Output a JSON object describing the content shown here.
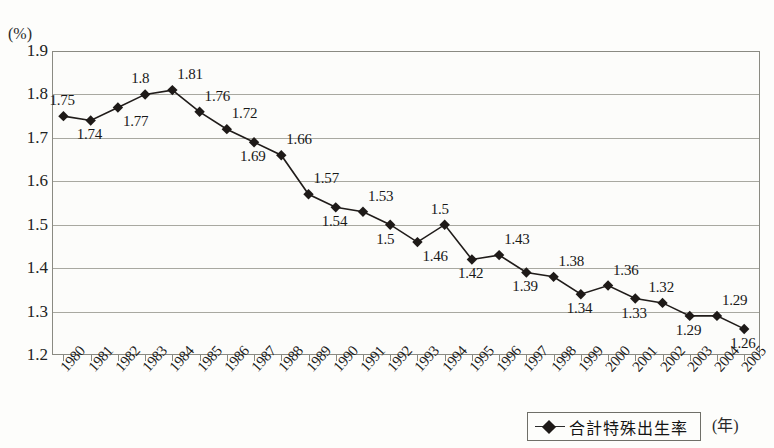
{
  "chart_data": {
    "type": "line",
    "title": "",
    "xlabel": "(年)",
    "ylabel": "(%)",
    "ylim": [
      1.2,
      1.9
    ],
    "ytick_labels": [
      "1.9",
      "1.8",
      "1.7",
      "1.6",
      "1.5",
      "1.4",
      "1.3",
      "1.2"
    ],
    "ytick_values": [
      1.9,
      1.8,
      1.7,
      1.6,
      1.5,
      1.4,
      1.3,
      1.2
    ],
    "grid": true,
    "legend_position": "bottom-right",
    "series": [
      {
        "name": "合計特殊出生率",
        "marker": "diamond",
        "color": "#1e1a18",
        "values": [
          1.75,
          1.74,
          1.77,
          1.8,
          1.81,
          1.76,
          1.72,
          1.69,
          1.66,
          1.57,
          1.54,
          1.53,
          1.5,
          1.46,
          1.5,
          1.42,
          1.43,
          1.39,
          1.38,
          1.34,
          1.36,
          1.33,
          1.32,
          1.29,
          1.29,
          1.26
        ]
      }
    ],
    "categories": [
      "1980",
      "1981",
      "1982",
      "1983",
      "1984",
      "1985",
      "1986",
      "1987",
      "1988",
      "1989",
      "1990",
      "1991",
      "1992",
      "1993",
      "1994",
      "1995",
      "1996",
      "1997",
      "1998",
      "1999",
      "2000",
      "2001",
      "2002",
      "2003",
      "2004",
      "2005"
    ],
    "point_labels": [
      {
        "year": "1980",
        "text": "1.75",
        "pos": "above"
      },
      {
        "year": "1981",
        "text": "1.74",
        "pos": "below"
      },
      {
        "year": "1982",
        "text": "1.77",
        "pos": "below-right"
      },
      {
        "year": "1983",
        "text": "1.8",
        "pos": "above"
      },
      {
        "year": "1984",
        "text": "1.81",
        "pos": "above-right"
      },
      {
        "year": "1985",
        "text": "1.76",
        "pos": "above-right"
      },
      {
        "year": "1986",
        "text": "1.72",
        "pos": "above-right"
      },
      {
        "year": "1987",
        "text": "1.69",
        "pos": "below"
      },
      {
        "year": "1988",
        "text": "1.66",
        "pos": "above-right"
      },
      {
        "year": "1989",
        "text": "1.57",
        "pos": "above-right"
      },
      {
        "year": "1990",
        "text": "1.54",
        "pos": "below"
      },
      {
        "year": "1991",
        "text": "1.53",
        "pos": "above-right"
      },
      {
        "year": "1992",
        "text": "1.5",
        "pos": "below"
      },
      {
        "year": "1993",
        "text": "1.46",
        "pos": "below-right"
      },
      {
        "year": "1994",
        "text": "1.5",
        "pos": "above"
      },
      {
        "year": "1995",
        "text": "1.42",
        "pos": "below"
      },
      {
        "year": "1996",
        "text": "1.43",
        "pos": "above-right"
      },
      {
        "year": "1997",
        "text": "1.39",
        "pos": "below"
      },
      {
        "year": "1998",
        "text": "1.38",
        "pos": "above-right"
      },
      {
        "year": "1999",
        "text": "1.34",
        "pos": "below"
      },
      {
        "year": "2000",
        "text": "1.36",
        "pos": "above-right"
      },
      {
        "year": "2001",
        "text": "1.33",
        "pos": "below"
      },
      {
        "year": "2002",
        "text": "1.32",
        "pos": "above"
      },
      {
        "year": "2003",
        "text": "1.29",
        "pos": "below"
      },
      {
        "year": "2004",
        "text": "1.29",
        "pos": "above-right"
      },
      {
        "year": "2005",
        "text": "1.26",
        "pos": "below"
      }
    ]
  },
  "legend": {
    "label": "合計特殊出生率"
  },
  "axes": {
    "y_unit": "(%)",
    "x_unit": "(年)"
  }
}
